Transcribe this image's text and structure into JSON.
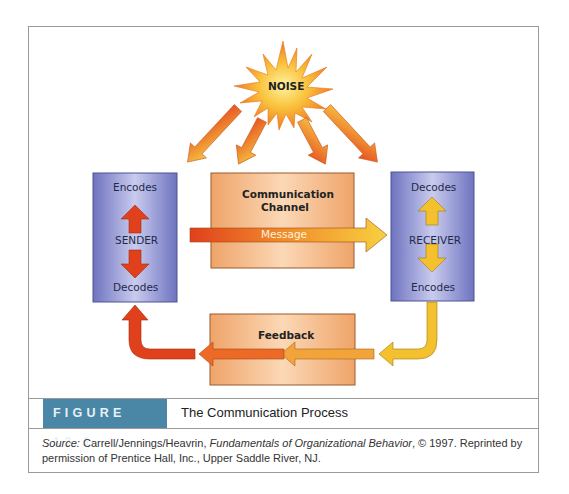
{
  "diagram": {
    "noise": {
      "label": "NOISE",
      "color": "#f5a623"
    },
    "sender": {
      "title": "SENDER",
      "top_label": "Encodes",
      "bottom_label": "Decodes",
      "box_color": "#8a8fcf",
      "arrow_color": "#e0401c"
    },
    "channel": {
      "title_line1": "Communication",
      "title_line2": "Channel",
      "box_color": "#f2b27a"
    },
    "message": {
      "label": "Message"
    },
    "receiver": {
      "title": "RECEIVER",
      "top_label": "Decodes",
      "bottom_label": "Encodes",
      "box_color": "#8a8fcf",
      "arrow_color": "#f3c12e"
    },
    "feedback": {
      "label": "Feedback",
      "box_color": "#f2b27a"
    }
  },
  "caption": {
    "figure_label": "FIGURE 12.1",
    "figure_title": "The Communication Process",
    "label_color": "#4a87a6",
    "source_prefix": "Source:",
    "source_authors": " Carrell/Jennings/Heavrin, ",
    "source_book": "Fundamentals of Organizational Behavior",
    "source_rest": ", © 1997. Reprinted by permission of Prentice Hall, Inc., Upper Saddle River, NJ."
  }
}
